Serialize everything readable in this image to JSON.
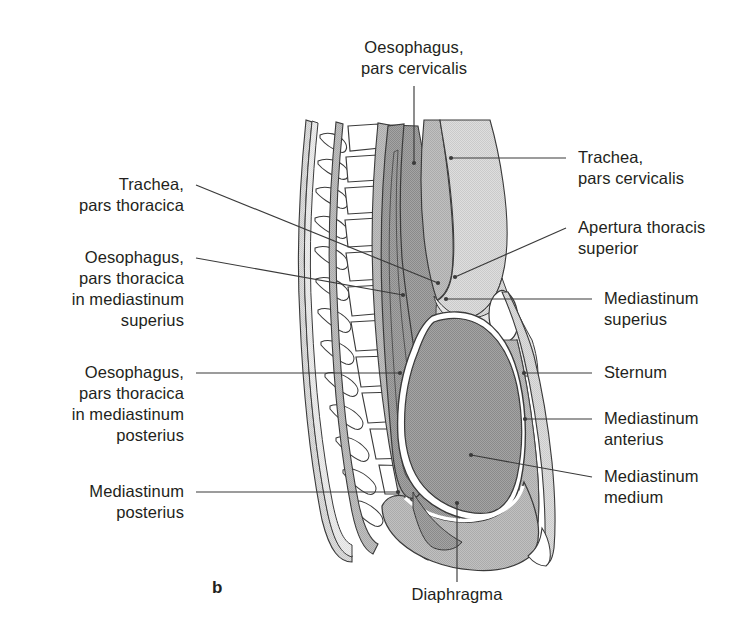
{
  "figure": {
    "panel_letter": "b",
    "colors": {
      "outline": "#3a3a3a",
      "heart_fill": "#9a9a9a",
      "mediastinum_posterius_fill": "#b5b5b5",
      "mediastinum_superius_fill": "#d2d2d2",
      "soft_tissue_fill": "#c9c9c9",
      "body_wall_fill": "#e2e2e2",
      "bone_fill": "#ffffff",
      "text": "#231f20",
      "leader_line": "#3a3a3a"
    }
  },
  "labels": {
    "oesophagus_pars_cervicalis": {
      "line1": "Oesophagus,",
      "line2": "pars cervicalis"
    },
    "trachea_pars_cervicalis": {
      "line1": "Trachea,",
      "line2": "pars cervicalis"
    },
    "apertura_thoracis_superior": {
      "line1": "Apertura thoracis",
      "line2": "superior"
    },
    "mediastinum_superius": {
      "line1": "Mediastinum",
      "line2": "superius"
    },
    "sternum": {
      "line1": "Sternum"
    },
    "mediastinum_anterius": {
      "line1": "Mediastinum",
      "line2": "anterius"
    },
    "mediastinum_medium": {
      "line1": "Mediastinum",
      "line2": "medium"
    },
    "trachea_pars_thoracica": {
      "line1": "Trachea,",
      "line2": "pars thoracica"
    },
    "oesophagus_thoracica_superius": {
      "line1": "Oesophagus,",
      "line2": "pars thoracica",
      "line3": "in mediastinum",
      "line4": "superius"
    },
    "oesophagus_thoracica_posterius": {
      "line1": "Oesophagus,",
      "line2": "pars thoracica",
      "line3": "in mediastinum",
      "line4": "posterius"
    },
    "mediastinum_posterius": {
      "line1": "Mediastinum",
      "line2": "posterius"
    },
    "diaphragma": {
      "line1": "Diaphragma"
    }
  },
  "label_text": {
    "oesophagus_pars_cervicalis": "Oesophagus,\npars cervicalis",
    "trachea_pars_cervicalis": "Trachea,\npars cervicalis",
    "apertura_thoracis_superior": "Apertura thoracis\nsuperior",
    "mediastinum_superius": "Mediastinum\nsuperius",
    "sternum": "Sternum",
    "mediastinum_anterius": "Mediastinum\nanterius",
    "mediastinum_medium": "Mediastinum\nmedium",
    "trachea_pars_thoracica": "Trachea,\npars thoracica",
    "oesophagus_thoracica_superius": "Oesophagus,\npars thoracica\nin mediastinum\nsuperius",
    "oesophagus_thoracica_posterius": "Oesophagus,\npars thoracica\nin mediastinum\nposterius",
    "mediastinum_posterius": "Mediastinum\nposterius",
    "diaphragma": "Diaphragma",
    "panel_letter": "b"
  }
}
